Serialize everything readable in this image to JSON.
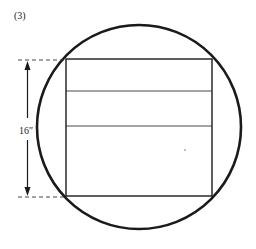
{
  "figure": {
    "label": "(3)",
    "dimension_label": "16″"
  },
  "colors": {
    "stroke": "#1a1a1a",
    "background": "#ffffff"
  }
}
